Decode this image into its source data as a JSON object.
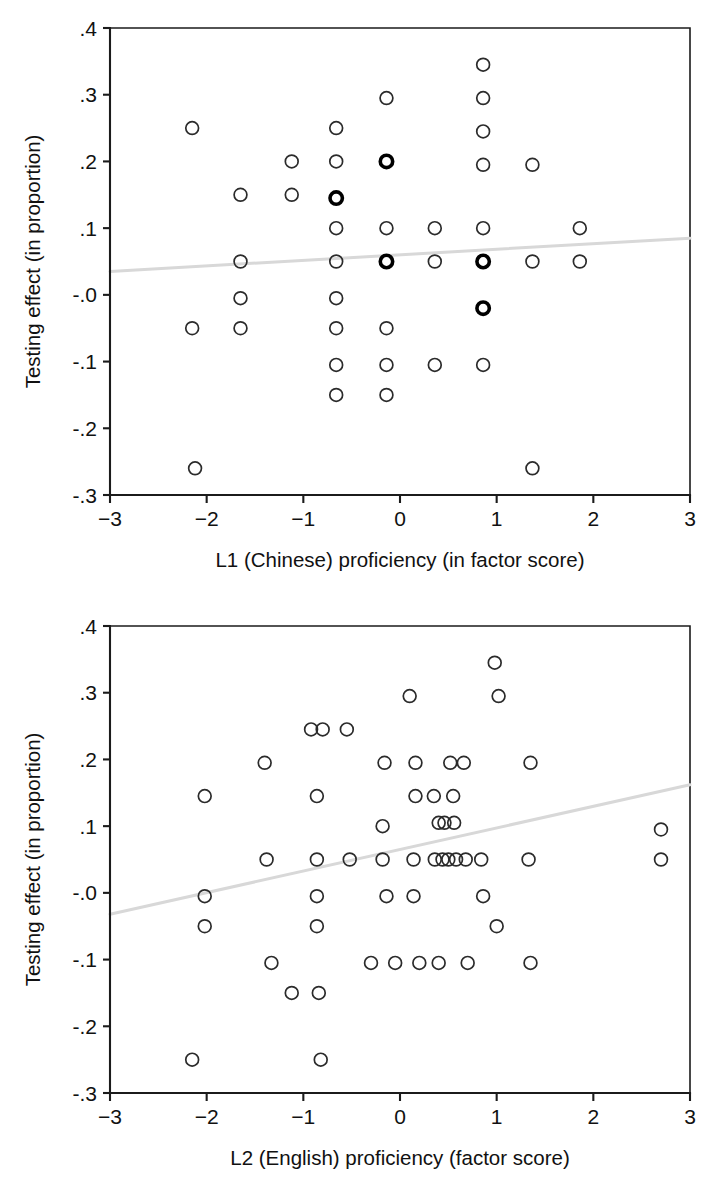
{
  "figure": {
    "background": "#ffffff",
    "marker_color": "#2b2b2b",
    "fitline_color": "#d8d8d8",
    "axis_color": "#1b1b1b"
  },
  "chart_data": [
    {
      "type": "scatter",
      "title": "",
      "xlabel": "L1 (Chinese) proficiency (in factor score)",
      "ylabel": "Testing effect (in proportion)",
      "xlim": [
        -3,
        3
      ],
      "ylim": [
        -0.3,
        0.4
      ],
      "grid": false,
      "legend": "none",
      "xticks": [
        -3,
        -2,
        -1,
        0,
        1,
        2,
        3
      ],
      "xticklabels": [
        "−3",
        "−2",
        "−1",
        "0",
        "1",
        "2",
        "3"
      ],
      "yticks": [
        0.4,
        0.3,
        0.2,
        0.1,
        -0.0,
        -0.1,
        -0.2,
        -0.3
      ],
      "yticklabels": [
        ".4",
        ".3",
        ".2",
        ".1",
        "-.0",
        "-.1",
        "-.2",
        "-.3"
      ],
      "fit_line": {
        "x": [
          -3,
          3
        ],
        "y": [
          0.035,
          0.085
        ],
        "style": "solid",
        "color": "#d8d8d8"
      },
      "points": [
        {
          "x": -2.15,
          "y": 0.25,
          "emphasis": false
        },
        {
          "x": -2.15,
          "y": -0.05,
          "emphasis": false
        },
        {
          "x": -2.12,
          "y": -0.26,
          "emphasis": false
        },
        {
          "x": -1.65,
          "y": 0.15,
          "emphasis": false
        },
        {
          "x": -1.65,
          "y": 0.05,
          "emphasis": false
        },
        {
          "x": -1.65,
          "y": -0.005,
          "emphasis": false
        },
        {
          "x": -1.65,
          "y": -0.05,
          "emphasis": false
        },
        {
          "x": -1.12,
          "y": 0.2,
          "emphasis": false
        },
        {
          "x": -1.12,
          "y": 0.15,
          "emphasis": false
        },
        {
          "x": -0.66,
          "y": 0.25,
          "emphasis": false
        },
        {
          "x": -0.66,
          "y": 0.2,
          "emphasis": false
        },
        {
          "x": -0.66,
          "y": 0.145,
          "emphasis": true
        },
        {
          "x": -0.66,
          "y": 0.1,
          "emphasis": false
        },
        {
          "x": -0.66,
          "y": 0.05,
          "emphasis": false
        },
        {
          "x": -0.66,
          "y": -0.005,
          "emphasis": false
        },
        {
          "x": -0.66,
          "y": -0.05,
          "emphasis": false
        },
        {
          "x": -0.66,
          "y": -0.105,
          "emphasis": false
        },
        {
          "x": -0.66,
          "y": -0.15,
          "emphasis": false
        },
        {
          "x": -0.14,
          "y": 0.295,
          "emphasis": false
        },
        {
          "x": -0.14,
          "y": 0.2,
          "emphasis": true
        },
        {
          "x": -0.14,
          "y": 0.1,
          "emphasis": false
        },
        {
          "x": -0.14,
          "y": 0.05,
          "emphasis": true
        },
        {
          "x": -0.14,
          "y": -0.05,
          "emphasis": false
        },
        {
          "x": -0.14,
          "y": -0.105,
          "emphasis": false
        },
        {
          "x": -0.14,
          "y": -0.15,
          "emphasis": false
        },
        {
          "x": 0.36,
          "y": 0.1,
          "emphasis": false
        },
        {
          "x": 0.36,
          "y": 0.05,
          "emphasis": false
        },
        {
          "x": 0.36,
          "y": -0.105,
          "emphasis": false
        },
        {
          "x": 0.86,
          "y": 0.345,
          "emphasis": false
        },
        {
          "x": 0.86,
          "y": 0.295,
          "emphasis": false
        },
        {
          "x": 0.86,
          "y": 0.245,
          "emphasis": false
        },
        {
          "x": 0.86,
          "y": 0.195,
          "emphasis": false
        },
        {
          "x": 0.86,
          "y": 0.1,
          "emphasis": false
        },
        {
          "x": 0.86,
          "y": 0.05,
          "emphasis": true
        },
        {
          "x": 0.86,
          "y": -0.02,
          "emphasis": true
        },
        {
          "x": 0.86,
          "y": -0.105,
          "emphasis": false
        },
        {
          "x": 1.37,
          "y": 0.195,
          "emphasis": false
        },
        {
          "x": 1.37,
          "y": 0.05,
          "emphasis": false
        },
        {
          "x": 1.37,
          "y": -0.26,
          "emphasis": false
        },
        {
          "x": 1.86,
          "y": 0.1,
          "emphasis": false
        },
        {
          "x": 1.86,
          "y": 0.05,
          "emphasis": false
        }
      ]
    },
    {
      "type": "scatter",
      "title": "",
      "xlabel": "L2 (English) proficiency (factor score)",
      "ylabel": "Testing effect (in proportion)",
      "xlim": [
        -3,
        3
      ],
      "ylim": [
        -0.3,
        0.4
      ],
      "grid": false,
      "legend": "none",
      "xticks": [
        -3,
        -2,
        -1,
        0,
        1,
        2,
        3
      ],
      "xticklabels": [
        "−3",
        "−2",
        "−1",
        "0",
        "1",
        "2",
        "3"
      ],
      "yticks": [
        0.4,
        0.3,
        0.2,
        0.1,
        -0.0,
        -0.1,
        -0.2,
        -0.3
      ],
      "yticklabels": [
        ".4",
        ".3",
        ".2",
        ".1",
        "-.0",
        "-.1",
        "-.2",
        "-.3"
      ],
      "fit_line": {
        "x": [
          -3,
          3
        ],
        "y": [
          -0.032,
          0.162
        ],
        "style": "solid",
        "color": "#d8d8d8"
      },
      "points": [
        {
          "x": -2.15,
          "y": -0.25,
          "emphasis": false
        },
        {
          "x": -2.02,
          "y": 0.145,
          "emphasis": false
        },
        {
          "x": -2.02,
          "y": -0.005,
          "emphasis": false
        },
        {
          "x": -2.02,
          "y": -0.05,
          "emphasis": false
        },
        {
          "x": -1.4,
          "y": 0.195,
          "emphasis": false
        },
        {
          "x": -1.38,
          "y": 0.05,
          "emphasis": false
        },
        {
          "x": -1.33,
          "y": -0.105,
          "emphasis": false
        },
        {
          "x": -1.12,
          "y": -0.15,
          "emphasis": false
        },
        {
          "x": -0.92,
          "y": 0.245,
          "emphasis": false
        },
        {
          "x": -0.8,
          "y": 0.245,
          "emphasis": false
        },
        {
          "x": -0.86,
          "y": 0.145,
          "emphasis": false
        },
        {
          "x": -0.86,
          "y": 0.05,
          "emphasis": false
        },
        {
          "x": -0.86,
          "y": -0.005,
          "emphasis": false
        },
        {
          "x": -0.86,
          "y": -0.05,
          "emphasis": false
        },
        {
          "x": -0.84,
          "y": -0.15,
          "emphasis": false
        },
        {
          "x": -0.82,
          "y": -0.25,
          "emphasis": false
        },
        {
          "x": -0.55,
          "y": 0.245,
          "emphasis": false
        },
        {
          "x": -0.52,
          "y": 0.05,
          "emphasis": false
        },
        {
          "x": -0.3,
          "y": -0.105,
          "emphasis": false
        },
        {
          "x": -0.16,
          "y": 0.195,
          "emphasis": false
        },
        {
          "x": -0.18,
          "y": 0.1,
          "emphasis": false
        },
        {
          "x": -0.18,
          "y": 0.05,
          "emphasis": false
        },
        {
          "x": -0.14,
          "y": -0.005,
          "emphasis": false
        },
        {
          "x": -0.05,
          "y": -0.105,
          "emphasis": false
        },
        {
          "x": 0.1,
          "y": 0.295,
          "emphasis": false
        },
        {
          "x": 0.16,
          "y": 0.195,
          "emphasis": false
        },
        {
          "x": 0.16,
          "y": 0.145,
          "emphasis": false
        },
        {
          "x": 0.14,
          "y": 0.05,
          "emphasis": false
        },
        {
          "x": 0.14,
          "y": -0.005,
          "emphasis": false
        },
        {
          "x": 0.2,
          "y": -0.105,
          "emphasis": false
        },
        {
          "x": 0.35,
          "y": 0.145,
          "emphasis": false
        },
        {
          "x": 0.4,
          "y": 0.105,
          "emphasis": false
        },
        {
          "x": 0.46,
          "y": 0.105,
          "emphasis": false
        },
        {
          "x": 0.36,
          "y": 0.05,
          "emphasis": false
        },
        {
          "x": 0.44,
          "y": 0.05,
          "emphasis": false
        },
        {
          "x": 0.5,
          "y": 0.05,
          "emphasis": false
        },
        {
          "x": 0.4,
          "y": -0.105,
          "emphasis": false
        },
        {
          "x": 0.52,
          "y": 0.195,
          "emphasis": false
        },
        {
          "x": 0.55,
          "y": 0.145,
          "emphasis": false
        },
        {
          "x": 0.56,
          "y": 0.105,
          "emphasis": false
        },
        {
          "x": 0.58,
          "y": 0.05,
          "emphasis": false
        },
        {
          "x": 0.66,
          "y": 0.195,
          "emphasis": false
        },
        {
          "x": 0.68,
          "y": 0.05,
          "emphasis": false
        },
        {
          "x": 0.7,
          "y": -0.105,
          "emphasis": false
        },
        {
          "x": 0.84,
          "y": 0.05,
          "emphasis": false
        },
        {
          "x": 0.86,
          "y": -0.005,
          "emphasis": false
        },
        {
          "x": 0.98,
          "y": 0.345,
          "emphasis": false
        },
        {
          "x": 1.02,
          "y": 0.295,
          "emphasis": false
        },
        {
          "x": 1.0,
          "y": -0.05,
          "emphasis": false
        },
        {
          "x": 1.35,
          "y": 0.195,
          "emphasis": false
        },
        {
          "x": 1.33,
          "y": 0.05,
          "emphasis": false
        },
        {
          "x": 1.35,
          "y": -0.105,
          "emphasis": false
        },
        {
          "x": 2.7,
          "y": 0.095,
          "emphasis": false
        },
        {
          "x": 2.7,
          "y": 0.05,
          "emphasis": false
        }
      ]
    }
  ]
}
